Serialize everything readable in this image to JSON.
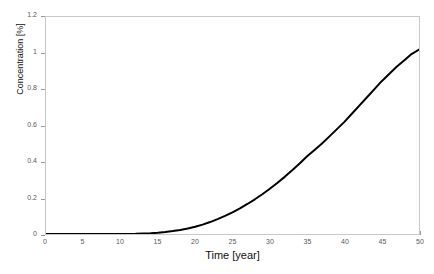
{
  "figure": {
    "background_color": "#ffffff",
    "frame_color": "#c8c8c8",
    "tick_color": "#9a9a9a",
    "tick_label_color": "#595959",
    "axis_title_color": "#111111"
  },
  "chart_data": {
    "type": "line",
    "title": "",
    "xlabel": "Time [year]",
    "ylabel": "Concentration [%]",
    "xlim": [
      0,
      50
    ],
    "ylim": [
      0,
      1.2
    ],
    "grid": false,
    "legend": null,
    "line_color": "#000000",
    "line_width": 2,
    "xticks": [
      0,
      5,
      10,
      15,
      20,
      25,
      30,
      35,
      40,
      45,
      50
    ],
    "xtick_labels": [
      "0",
      "5",
      "10",
      "15",
      "20",
      "25",
      "30",
      "35",
      "40",
      "45",
      "50"
    ],
    "yticks": [
      0,
      0.2,
      0.4,
      0.6,
      0.8,
      1,
      1.2
    ],
    "ytick_labels": [
      "0",
      "0.2",
      "0.4",
      "0.6",
      "0.8",
      "1",
      "1.2"
    ],
    "series": [
      {
        "name": "Concentration",
        "x": [
          0,
          2,
          4,
          6,
          8,
          10,
          12,
          14,
          15,
          16,
          17,
          18,
          19,
          20,
          21,
          22,
          23,
          24,
          25,
          26,
          27,
          28,
          29,
          30,
          31,
          32,
          33,
          34,
          35,
          36,
          37,
          38,
          39,
          40,
          41,
          42,
          43,
          44,
          45,
          46,
          47,
          48,
          49,
          50
        ],
        "y": [
          0.0,
          0.0,
          0.0,
          0.0,
          0.0,
          0.0,
          0.001,
          0.004,
          0.007,
          0.011,
          0.016,
          0.022,
          0.03,
          0.04,
          0.052,
          0.066,
          0.082,
          0.1,
          0.12,
          0.142,
          0.166,
          0.192,
          0.22,
          0.25,
          0.282,
          0.316,
          0.352,
          0.39,
          0.43,
          0.465,
          0.5,
          0.54,
          0.58,
          0.62,
          0.665,
          0.71,
          0.755,
          0.8,
          0.845,
          0.885,
          0.925,
          0.96,
          0.995,
          1.02
        ]
      }
    ]
  },
  "caption": {
    "cut_off_text": ""
  }
}
